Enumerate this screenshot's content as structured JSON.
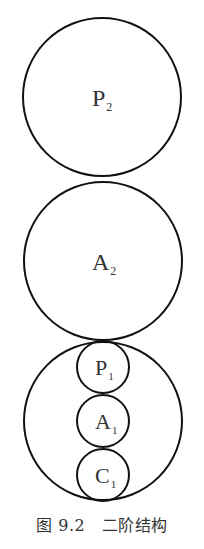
{
  "diagram": {
    "stroke_color": "#111111",
    "circles": [
      {
        "id": "p2",
        "label": "P",
        "sub": "2",
        "cx": 102,
        "cy": 97,
        "r": 79
      },
      {
        "id": "a2",
        "label": "A",
        "sub": "2",
        "cx": 103,
        "cy": 261,
        "r": 79
      },
      {
        "id": "outer1",
        "label": "",
        "sub": "",
        "cx": 103,
        "cy": 421,
        "r": 79
      },
      {
        "id": "p1",
        "label": "P",
        "sub": "1",
        "cx": 103,
        "cy": 367,
        "r": 26
      },
      {
        "id": "a1",
        "label": "A",
        "sub": "1",
        "cx": 103,
        "cy": 421,
        "r": 26
      },
      {
        "id": "c1",
        "label": "C",
        "sub": "1",
        "cx": 103,
        "cy": 475,
        "r": 26
      }
    ]
  },
  "caption": {
    "figure_number": "图 9.2",
    "title": "二阶结构",
    "full": "图 9.2　二阶结构"
  }
}
